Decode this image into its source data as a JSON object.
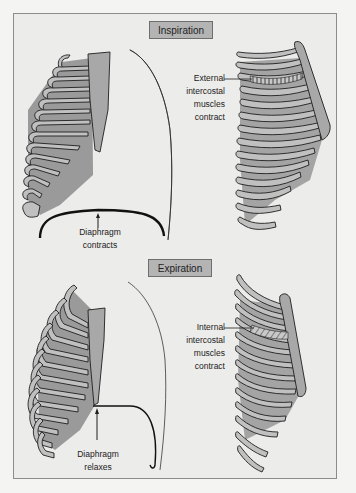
{
  "figure": {
    "sections": [
      {
        "id": "inspiration",
        "label": "Inspiration",
        "side_view": {
          "annotation": [
            "Diaphragm",
            "contracts"
          ],
          "diaphragm_shape": "flattened dome"
        },
        "rib_view": {
          "annotation": [
            "External",
            "intercostal",
            "muscles",
            "contract"
          ],
          "muscle_pattern": "vertical hatching"
        }
      },
      {
        "id": "expiration",
        "label": "Expiration",
        "side_view": {
          "annotation": [
            "Diaphragm",
            "relaxes"
          ],
          "diaphragm_shape": "raised dome"
        },
        "rib_view": {
          "annotation": [
            "Internal",
            "intercostal",
            "muscles",
            "contract"
          ],
          "muscle_pattern": "diagonal hatching"
        }
      }
    ],
    "colors": {
      "background": "#ececea",
      "frame_border": "#8c8c8c",
      "label_fill": "#b4b4b4",
      "rib_fill": "#b8b8b8",
      "rib_dark": "#989898",
      "outline": "#1e1e1e"
    }
  }
}
